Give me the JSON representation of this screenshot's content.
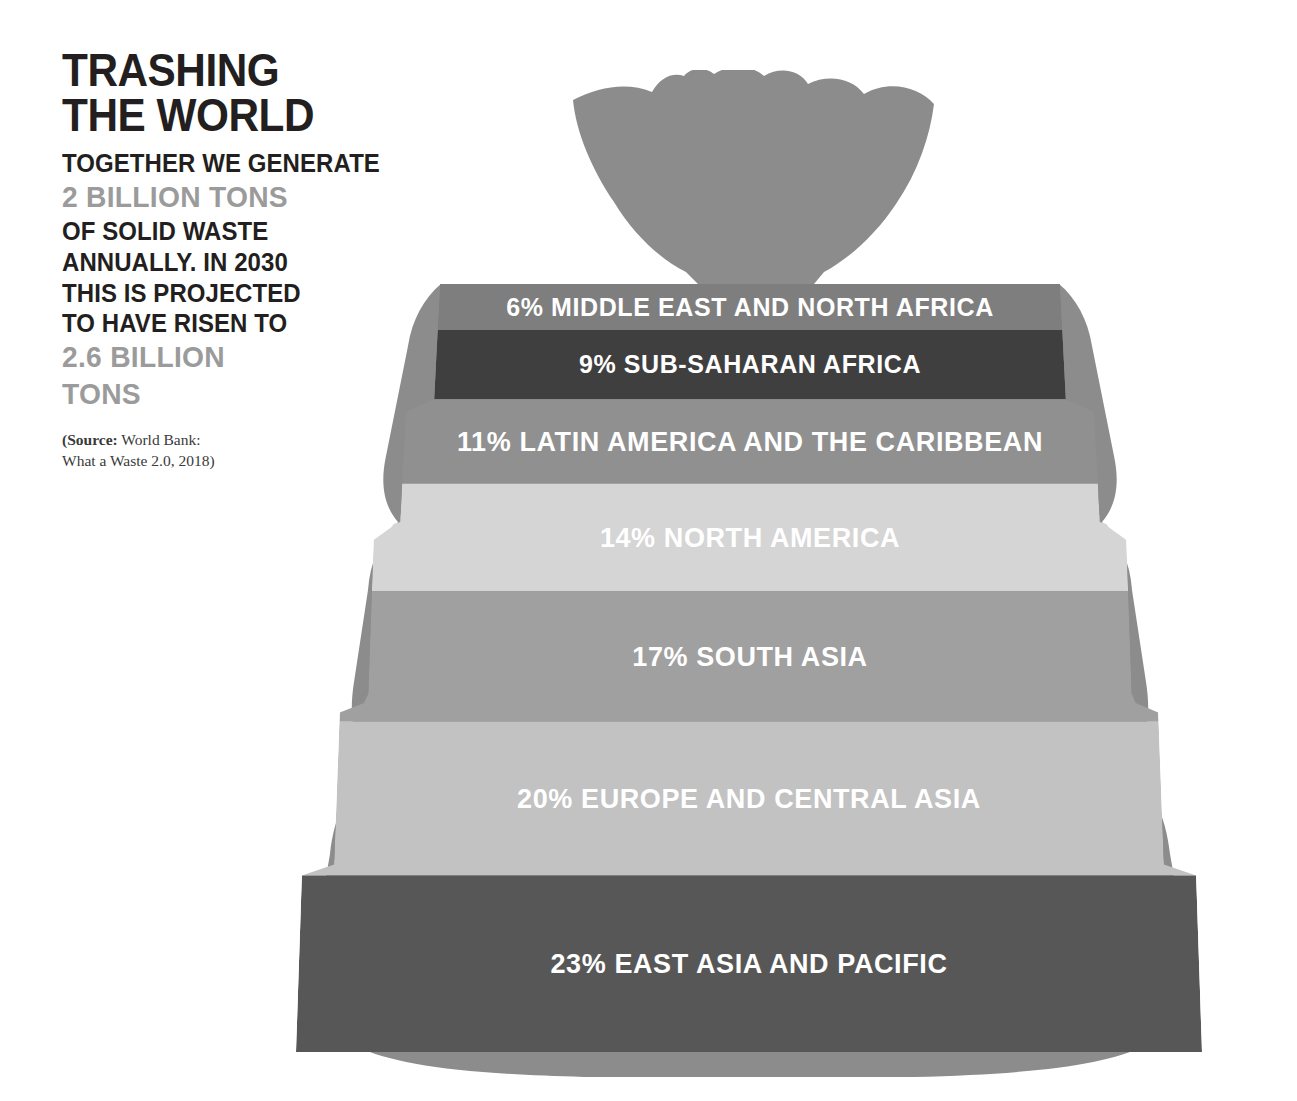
{
  "headline": {
    "line1": "TRASHING",
    "line2": "THE WORLD"
  },
  "intro": {
    "line1": "TOGETHER WE GENERATE",
    "highlight1": "2 BILLION TONS",
    "line2": "OF SOLID WASTE",
    "line3": "ANNUALLY. IN 2030",
    "line4": "THIS IS PROJECTED",
    "line5": "TO HAVE RISEN TO",
    "highlight2a": "2.6 BILLION",
    "highlight2b": "TONS"
  },
  "source": {
    "label": "(Source:",
    "line1_rest": " World Bank:",
    "line2": "What a Waste 2.0, 2018)"
  },
  "colors": {
    "bag_outline": "#8c8c8c",
    "knot": "#8c8c8c",
    "text_dark": "#231f20",
    "text_gray": "#9b9b9b",
    "label_text": "#ffffff"
  },
  "chart_data": {
    "type": "bar",
    "title": "TRASHING THE WORLD",
    "subtitle": "Share of global solid waste generated by region",
    "unit": "percent of global solid waste",
    "xlabel": "",
    "ylabel": "",
    "legend_position": "inline-labels",
    "grid": false,
    "orientation": "stacked-vertical",
    "categories": [
      "Middle East and North Africa",
      "Sub-Saharan Africa",
      "Latin America and the Caribbean",
      "North America",
      "South Asia",
      "Europe and Central Asia",
      "East Asia and Pacific"
    ],
    "values": [
      6,
      9,
      11,
      14,
      17,
      20,
      23
    ],
    "total": 100,
    "ylim": [
      0,
      100
    ],
    "annotations": [
      "Together we generate 2 billion tons of solid waste annually.",
      "In 2030 this is projected to have risen to 2.6 billion tons."
    ],
    "source": "World Bank: What a Waste 2.0, 2018"
  },
  "bands": [
    {
      "pct": "6%",
      "region": "MIDDLE EAST AND NORTH AFRICA",
      "label": "6% MIDDLE EAST AND NORTH AFRICA",
      "color": "#7e7e7e",
      "value": 6
    },
    {
      "pct": "9%",
      "region": "SUB-SAHARAN AFRICA",
      "label": "9% SUB-SAHARAN AFRICA",
      "color": "#3f3f3f",
      "value": 9
    },
    {
      "pct": "11%",
      "region": "LATIN AMERICA AND THE CARIBBEAN",
      "label": "11% LATIN AMERICA AND THE CARIBBEAN",
      "color": "#909090",
      "value": 11
    },
    {
      "pct": "14%",
      "region": "NORTH AMERICA",
      "label": "14% NORTH AMERICA",
      "color": "#d5d5d5",
      "value": 14
    },
    {
      "pct": "17%",
      "region": "SOUTH ASIA",
      "label": "17% SOUTH ASIA",
      "color": "#a0a0a0",
      "value": 17
    },
    {
      "pct": "20%",
      "region": "EUROPE AND CENTRAL ASIA",
      "label": "20% EUROPE AND CENTRAL ASIA",
      "color": "#c2c2c2",
      "value": 20
    },
    {
      "pct": "23%",
      "region": "EAST ASIA AND PACIFIC",
      "label": "23% EAST ASIA AND PACIFIC",
      "color": "#575757",
      "value": 23
    }
  ]
}
